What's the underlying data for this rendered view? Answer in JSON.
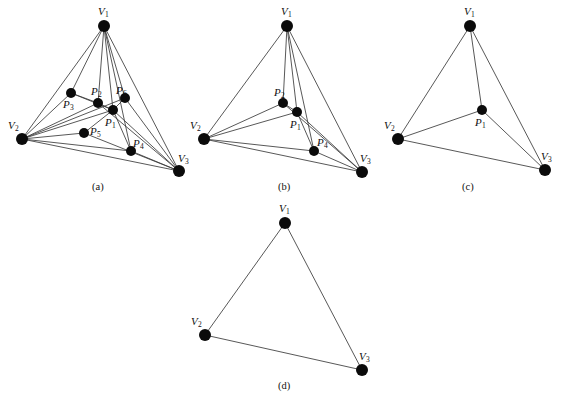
{
  "figure": {
    "background_color": "#ffffff",
    "edge_color": "#3a3a3a",
    "node_color": "#0b0b0b",
    "panels": [
      {
        "id": "a",
        "caption": "(a)",
        "caption_pos": [
          92,
          182
        ],
        "nodes": [
          {
            "name": "V1",
            "label": "V",
            "sub": "1",
            "x": 104,
            "y": 26,
            "r": 6.0,
            "label_pos": [
              98,
              6
            ]
          },
          {
            "name": "V2",
            "label": "V",
            "sub": "2",
            "x": 22,
            "y": 139,
            "r": 6.0,
            "label_pos": [
              8,
              120
            ]
          },
          {
            "name": "V3",
            "label": "V",
            "sub": "3",
            "x": 179,
            "y": 171,
            "r": 6.0,
            "label_pos": [
              178,
              153
            ]
          },
          {
            "name": "P1",
            "label": "P",
            "sub": "1",
            "x": 113,
            "y": 110,
            "r": 5.0,
            "label_pos": [
              105,
              117
            ]
          },
          {
            "name": "P2",
            "label": "P",
            "sub": "2",
            "x": 98,
            "y": 103,
            "r": 5.0,
            "label_pos": [
              91,
              86
            ]
          },
          {
            "name": "P3",
            "label": "P",
            "sub": "3",
            "x": 71,
            "y": 93,
            "r": 5.0,
            "label_pos": [
              63,
              99
            ]
          },
          {
            "name": "P4",
            "label": "P",
            "sub": "4",
            "x": 131,
            "y": 151,
            "r": 5.0,
            "label_pos": [
              133,
              138
            ]
          },
          {
            "name": "P5",
            "label": "P",
            "sub": "5",
            "x": 84,
            "y": 133,
            "r": 5.0,
            "label_pos": [
              90,
              126
            ]
          },
          {
            "name": "P6",
            "label": "P",
            "sub": "6",
            "x": 125,
            "y": 98,
            "r": 5.0,
            "label_pos": [
              116,
              85
            ]
          }
        ],
        "edges": [
          [
            "V1",
            "V2"
          ],
          [
            "V1",
            "V3"
          ],
          [
            "V2",
            "V3"
          ],
          [
            "V1",
            "P1"
          ],
          [
            "V1",
            "P2"
          ],
          [
            "V1",
            "P3"
          ],
          [
            "V1",
            "P6"
          ],
          [
            "V1",
            "P4"
          ],
          [
            "V2",
            "P1"
          ],
          [
            "V2",
            "P2"
          ],
          [
            "V2",
            "P3"
          ],
          [
            "V2",
            "P4"
          ],
          [
            "V2",
            "P5"
          ],
          [
            "V2",
            "P6"
          ],
          [
            "V3",
            "P1"
          ],
          [
            "V3",
            "P2"
          ],
          [
            "V3",
            "P4"
          ],
          [
            "V3",
            "P5"
          ],
          [
            "V3",
            "P6"
          ],
          [
            "P1",
            "P2"
          ],
          [
            "P1",
            "P3"
          ],
          [
            "P1",
            "P4"
          ],
          [
            "P1",
            "P5"
          ],
          [
            "P1",
            "P6"
          ],
          [
            "P2",
            "P3"
          ]
        ]
      },
      {
        "id": "b",
        "caption": "(b)",
        "caption_pos": [
          278,
          182
        ],
        "nodes": [
          {
            "name": "V1",
            "label": "V",
            "sub": "1",
            "x": 287,
            "y": 26,
            "r": 6.0,
            "label_pos": [
              281,
              6
            ]
          },
          {
            "name": "V2",
            "label": "V",
            "sub": "2",
            "x": 204,
            "y": 139,
            "r": 6.0,
            "label_pos": [
              190,
              120
            ]
          },
          {
            "name": "V3",
            "label": "V",
            "sub": "3",
            "x": 362,
            "y": 172,
            "r": 6.0,
            "label_pos": [
              360,
              153
            ]
          },
          {
            "name": "P1",
            "label": "P",
            "sub": "1",
            "x": 297,
            "y": 112,
            "r": 5.0,
            "label_pos": [
              290,
              119
            ]
          },
          {
            "name": "P2",
            "label": "P",
            "sub": "2",
            "x": 283,
            "y": 103,
            "r": 5.0,
            "label_pos": [
              274,
              87
            ]
          },
          {
            "name": "P4",
            "label": "P",
            "sub": "4",
            "x": 314,
            "y": 151,
            "r": 5.0,
            "label_pos": [
              317,
              137
            ]
          }
        ],
        "edges": [
          [
            "V1",
            "V2"
          ],
          [
            "V1",
            "V3"
          ],
          [
            "V2",
            "V3"
          ],
          [
            "V1",
            "P1"
          ],
          [
            "V1",
            "P2"
          ],
          [
            "V1",
            "P4"
          ],
          [
            "V2",
            "P1"
          ],
          [
            "V2",
            "P2"
          ],
          [
            "V2",
            "P4"
          ],
          [
            "V3",
            "P1"
          ],
          [
            "V3",
            "P2"
          ],
          [
            "V3",
            "P4"
          ],
          [
            "P1",
            "P2"
          ],
          [
            "P1",
            "P4"
          ]
        ]
      },
      {
        "id": "c",
        "caption": "(c)",
        "caption_pos": [
          462,
          182
        ],
        "nodes": [
          {
            "name": "V1",
            "label": "V",
            "sub": "1",
            "x": 470,
            "y": 26,
            "r": 6.0,
            "label_pos": [
              464,
              6
            ]
          },
          {
            "name": "V2",
            "label": "V",
            "sub": "2",
            "x": 398,
            "y": 139,
            "r": 6.0,
            "label_pos": [
              384,
              120
            ]
          },
          {
            "name": "V3",
            "label": "V",
            "sub": "3",
            "x": 545,
            "y": 170,
            "r": 6.0,
            "label_pos": [
              541,
              151
            ]
          },
          {
            "name": "P1",
            "label": "P",
            "sub": "1",
            "x": 482,
            "y": 110,
            "r": 5.0,
            "label_pos": [
              475,
              117
            ]
          }
        ],
        "edges": [
          [
            "V1",
            "V2"
          ],
          [
            "V1",
            "V3"
          ],
          [
            "V2",
            "V3"
          ],
          [
            "V1",
            "P1"
          ],
          [
            "V2",
            "P1"
          ],
          [
            "V3",
            "P1"
          ]
        ]
      },
      {
        "id": "d",
        "caption": "(d)",
        "caption_pos": [
          278,
          381
        ],
        "nodes": [
          {
            "name": "V1",
            "label": "V",
            "sub": "1",
            "x": 285,
            "y": 223,
            "r": 6.0,
            "label_pos": [
              279,
              203
            ]
          },
          {
            "name": "V2",
            "label": "V",
            "sub": "2",
            "x": 205,
            "y": 335,
            "r": 6.0,
            "label_pos": [
              191,
              316
            ]
          },
          {
            "name": "V3",
            "label": "V",
            "sub": "3",
            "x": 362,
            "y": 370,
            "r": 6.0,
            "label_pos": [
              359,
              351
            ]
          }
        ],
        "edges": [
          [
            "V1",
            "V2"
          ],
          [
            "V1",
            "V3"
          ],
          [
            "V2",
            "V3"
          ]
        ]
      }
    ]
  }
}
